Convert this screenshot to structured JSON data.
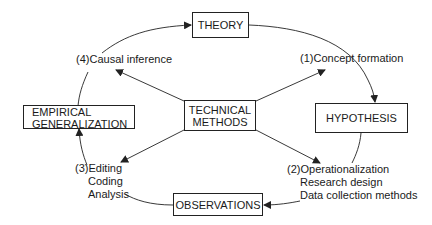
{
  "diagram": {
    "type": "cycle",
    "nodes": {
      "theory": {
        "label": "THEORY"
      },
      "hypothesis": {
        "label": "HYPOTHESIS"
      },
      "observations": {
        "label": "OBSERVATIONS"
      },
      "empirical": {
        "line1": "EMPIRICAL",
        "line2": "GENERALIZATION"
      },
      "technical": {
        "line1": "TECHNICAL",
        "line2": "METHODS"
      }
    },
    "steps": {
      "s1": {
        "num": "(1)",
        "lines": [
          "Concept formation"
        ]
      },
      "s2": {
        "num": "(2)",
        "lines": [
          "Operationalization",
          "Research design",
          "Data collection methods"
        ]
      },
      "s3": {
        "num": "(3)",
        "lines": [
          "Editing",
          "Coding",
          "Analysis"
        ]
      },
      "s4": {
        "num": "(4)",
        "lines": [
          "Causal inference"
        ]
      }
    },
    "colors": {
      "stroke": "#222222",
      "text": "#1a1a1a",
      "background": "#ffffff"
    }
  }
}
